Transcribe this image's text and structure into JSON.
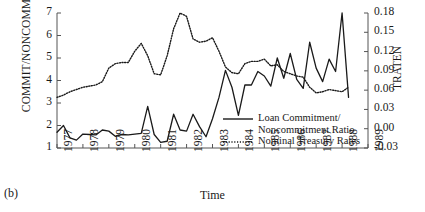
{
  "panel": {
    "label": "(b)"
  },
  "axes": {
    "left_title": "COMMIT/NONCOMMIT",
    "right_title": "TRATEN",
    "x_title": "Time",
    "left_ticks": [
      "7",
      "6",
      "5",
      "4",
      "3",
      "2",
      "1"
    ],
    "right_ticks": [
      "0.18",
      "0.15",
      "0.12",
      "0.09",
      "0.06",
      "0.03",
      "0.00",
      "-0.03"
    ],
    "x_ticks": [
      "1977",
      "1978",
      "1979",
      "1980",
      "1981",
      "1982",
      "1983",
      "1984",
      "1985",
      "1986",
      "1987",
      "1988",
      "1989"
    ]
  },
  "legend": {
    "items": [
      {
        "label_line1": "Loan Commitment/",
        "label_line2": "Noncommitment Ratio",
        "style": "solid"
      },
      {
        "label_line1": "Nominal Treasury Rates",
        "label_line2": "",
        "style": "dotted"
      }
    ]
  },
  "colors": {
    "ink": "#1a1a1a",
    "axis": "#555555"
  },
  "chart_data": {
    "type": "line",
    "title": "",
    "xlabel": "Time",
    "ylabel": "COMMIT/NONCOMMIT",
    "y2label": "TRATEN",
    "xlim": [
      1977.0,
      1989.0
    ],
    "ylim": [
      1,
      7
    ],
    "y2lim": [
      -0.03,
      0.18
    ],
    "grid": false,
    "legend_position": "center-right-inside",
    "series": [
      {
        "name": "Loan Commitment/Noncommitment Ratio",
        "axis": "left",
        "style": "solid",
        "x": [
          1977.0,
          1977.25,
          1977.5,
          1977.75,
          1978.0,
          1978.25,
          1978.5,
          1978.75,
          1979.0,
          1979.25,
          1979.5,
          1979.75,
          1980.0,
          1980.25,
          1980.5,
          1980.75,
          1981.0,
          1981.25,
          1981.5,
          1981.75,
          1982.0,
          1982.25,
          1982.5,
          1982.75,
          1983.0,
          1983.25,
          1983.5,
          1983.75,
          1984.0,
          1984.25,
          1984.5,
          1984.75,
          1985.0,
          1985.25,
          1985.5,
          1985.75,
          1986.0,
          1986.25,
          1986.5,
          1986.75,
          1987.0,
          1987.25,
          1987.5,
          1987.75,
          1988.0,
          1988.25
        ],
        "values": [
          1.7,
          2.0,
          1.45,
          1.35,
          1.62,
          1.6,
          1.58,
          1.8,
          1.75,
          1.52,
          1.6,
          1.58,
          1.62,
          1.65,
          2.85,
          1.6,
          1.25,
          1.3,
          2.5,
          1.8,
          1.75,
          2.5,
          1.95,
          1.5,
          2.3,
          3.25,
          4.45,
          3.7,
          2.45,
          3.8,
          3.8,
          4.4,
          4.2,
          3.75,
          5.0,
          4.1,
          5.2,
          4.05,
          3.65,
          5.7,
          4.55,
          3.95,
          4.95,
          4.4,
          7.0,
          3.25
        ]
      },
      {
        "name": "Nominal Treasury Rates",
        "axis": "right",
        "style": "dotted",
        "x": [
          1977.0,
          1977.25,
          1977.5,
          1977.75,
          1978.0,
          1978.25,
          1978.5,
          1978.75,
          1979.0,
          1979.25,
          1979.5,
          1979.75,
          1980.0,
          1980.25,
          1980.5,
          1980.75,
          1981.0,
          1981.25,
          1981.5,
          1981.75,
          1982.0,
          1982.25,
          1982.5,
          1982.75,
          1983.0,
          1983.25,
          1983.5,
          1983.75,
          1984.0,
          1984.25,
          1984.5,
          1984.75,
          1985.0,
          1985.25,
          1985.5,
          1985.75,
          1986.0,
          1986.25,
          1986.5,
          1986.75,
          1987.0,
          1987.25,
          1987.5,
          1987.75,
          1988.0,
          1988.25
        ],
        "values_left_scale": [
          3.25,
          3.35,
          3.5,
          3.6,
          3.7,
          3.75,
          3.8,
          3.95,
          4.55,
          4.75,
          4.8,
          4.8,
          5.3,
          5.65,
          5.1,
          4.3,
          4.25,
          5.1,
          6.3,
          7.0,
          6.85,
          5.85,
          5.7,
          5.75,
          5.9,
          5.3,
          4.6,
          4.35,
          4.3,
          4.75,
          4.85,
          4.85,
          4.95,
          4.65,
          4.7,
          4.4,
          4.3,
          4.2,
          4.15,
          3.7,
          3.45,
          3.5,
          3.6,
          3.55,
          3.5,
          3.7
        ],
        "values_traten": [
          0.0578,
          0.0613,
          0.0665,
          0.07,
          0.0735,
          0.0753,
          0.077,
          0.0823,
          0.1033,
          0.1103,
          0.112,
          0.112,
          0.1295,
          0.1418,
          0.1225,
          0.0945,
          0.0928,
          0.1225,
          0.1645,
          0.189,
          0.1838,
          0.1488,
          0.1435,
          0.1453,
          0.1508,
          0.1298,
          0.1053,
          0.0965,
          0.0945,
          0.1103,
          0.1138,
          0.1138,
          0.1173,
          0.1068,
          0.1085,
          0.098,
          0.0945,
          0.091,
          0.0893,
          0.0735,
          0.0648,
          0.0665,
          0.07,
          0.0683,
          0.0665,
          0.0735
        ]
      }
    ]
  }
}
